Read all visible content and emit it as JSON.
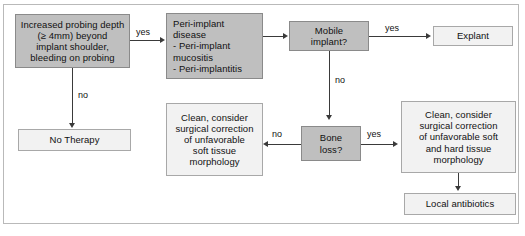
{
  "diagram": {
    "colors": {
      "node_fill_decision": "#bfbfbf",
      "node_fill_outcome": "#f2f2f2",
      "node_border_decision": "#8a8a8a",
      "node_border_outcome": "#a8a8a8",
      "edge": "#3a3a3a",
      "frame": "#b9b9b9",
      "text": "#111111",
      "background": "#ffffff"
    },
    "nodes": {
      "probing_depth": "Increased probing depth\n(≥ 4mm) beyond\nimplant shoulder,\nbleeding on probing",
      "peri_implant_disease": "Peri-implant\ndisease\n- Peri-implant\n   mucositis\n- Peri-implantitis",
      "mobile_implant": "Mobile\nimplant?",
      "explant": "Explant",
      "no_therapy": "No Therapy",
      "clean_soft": "Clean, consider\nsurgical correction\nof unfavorable\nsoft tissue\nmorphology",
      "bone_loss": "Bone\nloss?",
      "clean_soft_hard": "Clean, consider\nsurgical correction\nof unfavorable soft\nand hard tissue\nmorphology",
      "local_antibiotics": "Local antibiotics"
    },
    "edge_labels": {
      "probing_yes": "yes",
      "probing_no": "no",
      "mobile_yes": "yes",
      "mobile_no": "no",
      "bone_no": "no",
      "bone_yes": "yes"
    }
  }
}
